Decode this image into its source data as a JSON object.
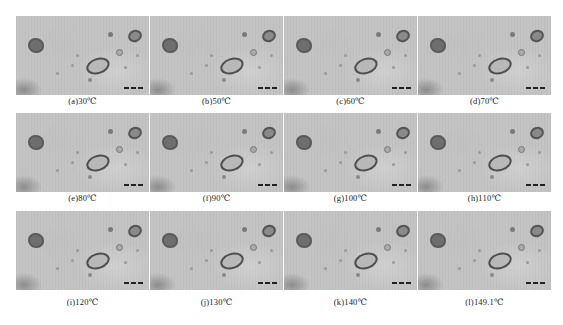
{
  "figure": {
    "panels": [
      {
        "label": "(a)30℃"
      },
      {
        "label": "(b)50℃"
      },
      {
        "label": "(c)60℃"
      },
      {
        "label": "(d)70℃"
      },
      {
        "label": "(e)80℃"
      },
      {
        "label": "(f)90℃"
      },
      {
        "label": "(g)100℃"
      },
      {
        "label": "(h)110℃"
      },
      {
        "label": "(i)120℃"
      },
      {
        "label": "(j)130℃"
      },
      {
        "label": "(k)140℃"
      },
      {
        "label": "(l)149.1℃"
      }
    ],
    "layout": {
      "rows": 3,
      "columns": 4
    },
    "colors": {
      "background": "#ffffff",
      "micrograph": "#c4c4c4",
      "inclusion_border": "#4e4e4e",
      "caption": "#222222"
    }
  }
}
